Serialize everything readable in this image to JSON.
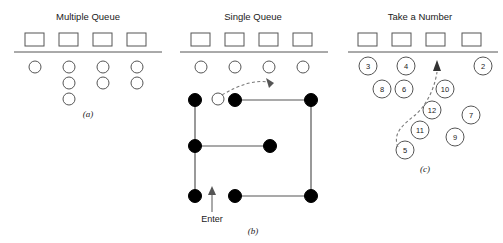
{
  "figure": {
    "width": 503,
    "height": 243,
    "background": "#ffffff",
    "ink_color": "#555555",
    "filled_color": "#000000",
    "text_color": "#1a1a1a"
  },
  "panels": [
    {
      "id": "a",
      "title": "Multiple Queue",
      "caption": "(a)",
      "title_x": 88,
      "title_y": 20,
      "caption_x": 88,
      "caption_y": 117,
      "counter_line": {
        "x1": 14,
        "y1": 52,
        "x2": 162,
        "y2": 52
      },
      "servers": [
        {
          "name": "server-1",
          "x": 25,
          "y": 33,
          "w": 19,
          "h": 13
        },
        {
          "name": "server-2",
          "x": 59,
          "y": 33,
          "w": 19,
          "h": 13
        },
        {
          "name": "server-3",
          "x": 93,
          "y": 33,
          "w": 19,
          "h": 13
        },
        {
          "name": "server-4",
          "x": 127,
          "y": 33,
          "w": 19,
          "h": 13
        }
      ],
      "customers": [
        {
          "cx": 35,
          "cy": 67,
          "r": 6
        },
        {
          "cx": 69,
          "cy": 67,
          "r": 6
        },
        {
          "cx": 103,
          "cy": 67,
          "r": 6
        },
        {
          "cx": 137,
          "cy": 67,
          "r": 6
        },
        {
          "cx": 69,
          "cy": 83,
          "r": 6
        },
        {
          "cx": 103,
          "cy": 83,
          "r": 6
        },
        {
          "cx": 137,
          "cy": 83,
          "r": 6
        },
        {
          "cx": 69,
          "cy": 99,
          "r": 6
        }
      ]
    },
    {
      "id": "b",
      "title": "Single Queue",
      "caption": "(b)",
      "title_x": 253,
      "title_y": 20,
      "caption_x": 253,
      "caption_y": 234,
      "counter_line": {
        "x1": 180,
        "y1": 52,
        "x2": 328,
        "y2": 52
      },
      "servers": [
        {
          "name": "server-1",
          "x": 191,
          "y": 33,
          "w": 19,
          "h": 13
        },
        {
          "name": "server-2",
          "x": 225,
          "y": 33,
          "w": 19,
          "h": 13
        },
        {
          "name": "server-3",
          "x": 259,
          "y": 33,
          "w": 19,
          "h": 13
        },
        {
          "name": "server-4",
          "x": 293,
          "y": 33,
          "w": 19,
          "h": 13
        }
      ],
      "customers": [
        {
          "cx": 201,
          "cy": 67,
          "r": 6
        },
        {
          "cx": 235,
          "cy": 67,
          "r": 6
        },
        {
          "cx": 269,
          "cy": 67,
          "r": 6
        },
        {
          "cx": 303,
          "cy": 67,
          "r": 6
        }
      ],
      "serpentine_path": "M 195 196 L 195 100 L 311 100 L 311 196 L 195 196",
      "queue_segments": [
        "M 195 100 L 195 196",
        "M 235 100 L 311 100",
        "M 311 100 L 311 196",
        "M 195 146 L 270 146",
        "M 235 196 L 311 196"
      ],
      "queue_dots": [
        {
          "name": "dot-head",
          "cx": 195,
          "cy": 100,
          "r": 6.5,
          "filled": true
        },
        {
          "name": "dot-leaving",
          "cx": 218,
          "cy": 99,
          "r": 6,
          "filled": false
        },
        {
          "name": "dot-row1-b",
          "cx": 235,
          "cy": 100,
          "r": 6.5,
          "filled": true
        },
        {
          "name": "dot-row1-right",
          "cx": 311,
          "cy": 100,
          "r": 6.5,
          "filled": true
        },
        {
          "name": "dot-row2-left",
          "cx": 195,
          "cy": 146,
          "r": 6.5,
          "filled": true
        },
        {
          "name": "dot-row2-right",
          "cx": 270,
          "cy": 146,
          "r": 6.5,
          "filled": true
        },
        {
          "name": "dot-row3-left",
          "cx": 195,
          "cy": 196,
          "r": 6.5,
          "filled": true
        },
        {
          "name": "dot-row3-mid",
          "cx": 235,
          "cy": 196,
          "r": 6.5,
          "filled": true
        },
        {
          "name": "dot-row3-right",
          "cx": 311,
          "cy": 196,
          "r": 6.5,
          "filled": true
        }
      ],
      "exit_arrow_path": "M 222 95 C 240 84 256 80 268 82",
      "exit_arrow_head": "269,88 266,78 274,83",
      "enter_label": "Enter",
      "enter_label_x": 212,
      "enter_label_y": 222,
      "enter_arrow_path": "M 212 212 L 212 191",
      "enter_arrow_head": "212,186 208,195 216,195"
    },
    {
      "id": "c",
      "title": "Take a Number",
      "caption": "(c)",
      "title_x": 420,
      "title_y": 20,
      "caption_x": 425,
      "caption_y": 172,
      "counter_line": {
        "x1": 348,
        "y1": 52,
        "x2": 498,
        "y2": 52
      },
      "servers": [
        {
          "name": "server-1",
          "x": 358,
          "y": 33,
          "w": 19,
          "h": 13
        },
        {
          "name": "server-2",
          "x": 392,
          "y": 33,
          "w": 19,
          "h": 13
        },
        {
          "name": "server-3",
          "x": 426,
          "y": 33,
          "w": 19,
          "h": 13
        },
        {
          "name": "server-4",
          "x": 462,
          "y": 33,
          "w": 19,
          "h": 13
        }
      ],
      "numbered_customers": [
        {
          "label": "3",
          "cx": 368,
          "cy": 66,
          "r": 9
        },
        {
          "label": "4",
          "cx": 406,
          "cy": 66,
          "r": 9
        },
        {
          "label": "2",
          "cx": 483,
          "cy": 66,
          "r": 9
        },
        {
          "label": "8",
          "cx": 382,
          "cy": 89,
          "r": 9
        },
        {
          "label": "6",
          "cx": 404,
          "cy": 89,
          "r": 9
        },
        {
          "label": "10",
          "cx": 445,
          "cy": 89,
          "r": 9
        },
        {
          "label": "12",
          "cx": 432,
          "cy": 110,
          "r": 9
        },
        {
          "label": "7",
          "cx": 471,
          "cy": 115,
          "r": 9
        },
        {
          "label": "11",
          "cx": 420,
          "cy": 130,
          "r": 9
        },
        {
          "label": "9",
          "cx": 455,
          "cy": 137,
          "r": 9
        },
        {
          "label": "5",
          "cx": 405,
          "cy": 150,
          "r": 9
        }
      ],
      "empty_slot": {
        "cx": 440,
        "cy": 66,
        "r": 9
      },
      "called_arrow_path": "M 398 147 C 392 133 404 124 414 116 C 424 108 434 92 437 72",
      "called_arrow_head": "437,60 433,71 441,71"
    }
  ]
}
